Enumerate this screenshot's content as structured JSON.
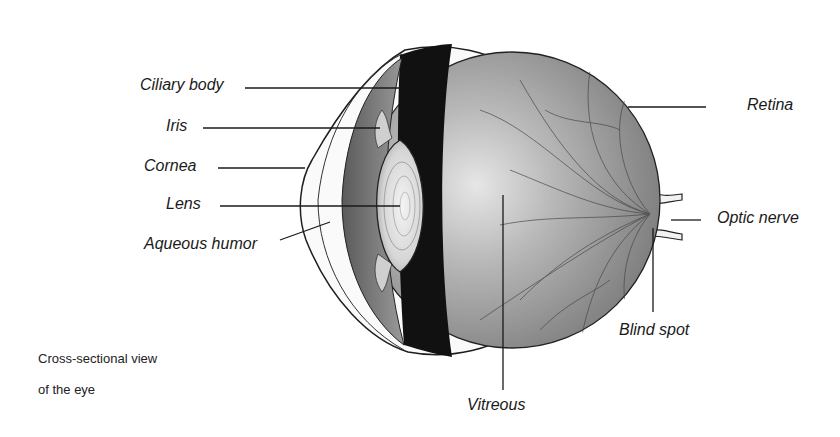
{
  "diagram": {
    "type": "anatomical-cross-section",
    "caption": {
      "line1": "Cross-sectional view",
      "line2": "of the eye"
    },
    "labels": {
      "ciliary_body": "Ciliary body",
      "iris": "Iris",
      "cornea": "Cornea",
      "lens": "Lens",
      "aqueous_humor": "Aqueous humor",
      "retina": "Retina",
      "optic_nerve": "Optic nerve",
      "blind_spot": "Blind spot",
      "vitreous": "Vitreous"
    },
    "colors": {
      "ink": "#1a1a1a",
      "background": "#ffffff",
      "choroid_dark": "#111111",
      "vitreous_gray": "#8a8a8a"
    }
  }
}
